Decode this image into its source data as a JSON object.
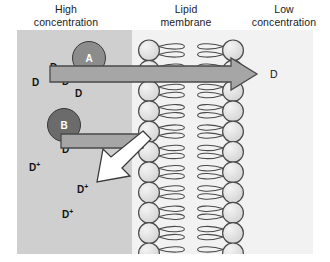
{
  "figure": {
    "type": "biology-diagram"
  },
  "top_labels": {
    "high": "High\nconcentration",
    "high_line1": "High",
    "high_line2": "concentration",
    "membrane_line1": "Lipid",
    "membrane_line2": "membrane",
    "low_line1": "Low",
    "low_line2": "concentration"
  },
  "regions": {
    "high_concentration_fill": "#cfcfcf",
    "low_concentration_fill": "#f2f2f2"
  },
  "carriers": [
    {
      "label": "A",
      "fill": "#8c8c8c",
      "stroke": "#3a3a3a"
    },
    {
      "label": "B",
      "fill": "#6b6b6b",
      "stroke": "#3a3a3a"
    }
  ],
  "solutes": {
    "neutral_label": "D",
    "charged_label": "D",
    "charged_superscript": "+",
    "neutral_positions": [
      {
        "x": 33,
        "y": 33
      },
      {
        "x": 15,
        "y": 48
      },
      {
        "x": 45,
        "y": 47
      },
      {
        "x": 58,
        "y": 59
      }
    ],
    "charged_positions": [
      {
        "x": 45,
        "y": 115
      },
      {
        "x": 12,
        "y": 133
      },
      {
        "x": 60,
        "y": 155
      },
      {
        "x": 45,
        "y": 180
      }
    ],
    "right_side_label": "D"
  },
  "membrane": {
    "head_count_per_leaflet": 11,
    "head_fill": "#e4e4e4",
    "head_stroke": "#4a4a4a",
    "tail_stroke": "#4a4a4a",
    "leaflet_left_x": 132,
    "leaflet_right_x": 216
  },
  "arrows": {
    "diffusion": {
      "name": "passive-diffusion-arrow",
      "direction": "right",
      "fill": "#a6a6a6",
      "stroke": "#4a4a4a"
    },
    "active_transport": {
      "name": "active-transport-arrow",
      "direction": "down-left",
      "fill": "#ffffff",
      "stroke": "#3a3a3a"
    }
  }
}
